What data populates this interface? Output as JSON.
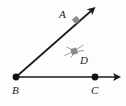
{
  "figure": {
    "name": "angle-diagram",
    "type": "geometry-diagram",
    "background_color": "#fdfdfd",
    "width": 126,
    "height": 106
  },
  "labels": {
    "a": "A",
    "b": "B",
    "c": "C",
    "d": "D"
  },
  "colors": {
    "line": "#1a1a1a",
    "vertex_dot": "#111111",
    "marker_gray": "#8a8a8a",
    "label_text": "#202020"
  },
  "geometry": {
    "vertex": {
      "name": "B",
      "x": 16,
      "y": 77
    },
    "rays": [
      {
        "name": "ray-BA",
        "from": {
          "x": 16,
          "y": 77
        },
        "to": {
          "x": 94,
          "y": 8
        },
        "arrowhead": "end",
        "label": "A"
      },
      {
        "name": "ray-BC",
        "from": {
          "x": 16,
          "y": 77
        },
        "to": {
          "x": 118,
          "y": 77
        },
        "arrowhead": "end",
        "label": "C"
      }
    ],
    "points": [
      {
        "name": "B",
        "x": 16,
        "y": 77,
        "style": "filled-dot",
        "radius": 3.2
      },
      {
        "name": "C",
        "x": 95,
        "y": 77,
        "style": "filled-dot",
        "radius": 3.2
      }
    ],
    "markers": [
      {
        "name": "square-marker-on-ray-BA",
        "x": 76,
        "y": 20,
        "size": 5,
        "style": "gray-square",
        "rays": 0
      },
      {
        "name": "point-marker-D",
        "x": 74,
        "y": 51,
        "size": 5,
        "style": "gray-square-with-radiating-lines",
        "rays": 4,
        "label": "D"
      }
    ]
  }
}
